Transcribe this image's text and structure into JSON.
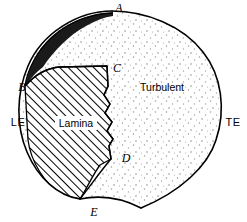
{
  "figure": {
    "background_color": "#ffffff",
    "line_color": "#000000",
    "width": 247,
    "height": 222
  },
  "point_labels": {
    "a": "A",
    "b": "B",
    "c": "C",
    "d": "D",
    "e": "E"
  },
  "edge_labels": {
    "leading": "LE",
    "trailing": "TE"
  },
  "region_labels": {
    "laminar": "Lamina",
    "turbulent": "Turbulent"
  },
  "regions": {
    "laminar": {
      "name": "Lamina",
      "fill_pattern": "diagonal-hatch",
      "hatch_color": "#000000",
      "hatch_angle_deg": 45
    },
    "turbulent": {
      "name": "Turbulent",
      "fill_pattern": "stipple-dots",
      "dot_color": "#8a8a8a"
    },
    "sliver": {
      "name": "leading-edge-sliver",
      "fill_pattern": "solid",
      "fill_color": "#000000"
    }
  }
}
